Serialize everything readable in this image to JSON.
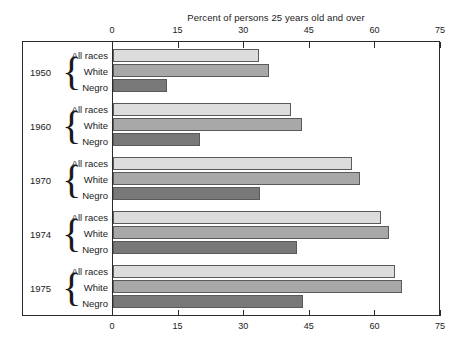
{
  "chart_data": {
    "type": "bar",
    "orientation": "horizontal",
    "title": "Percent of persons 25 years old and over",
    "xlabel": "",
    "ylabel": "",
    "xlim": [
      0,
      75
    ],
    "xticks": [
      0,
      15,
      30,
      45,
      60,
      75
    ],
    "xtick_labels": [
      "0",
      "15",
      "30",
      "45",
      "60",
      "75"
    ],
    "grid": false,
    "legend": "none",
    "axis_position": "both-top-and-bottom",
    "categories": [
      "1950",
      "1960",
      "1970",
      "1974",
      "1975"
    ],
    "series": [
      {
        "name": "All races",
        "color": "#dcdcdc",
        "values": [
          33.4,
          40.6,
          54.7,
          61.2,
          64.5
        ]
      },
      {
        "name": "White",
        "color": "#a8a8a8",
        "values": [
          35.7,
          43.2,
          56.4,
          63.0,
          66.0
        ]
      },
      {
        "name": "Negro",
        "color": "#787878",
        "values": [
          12.4,
          20.0,
          33.7,
          42.0,
          43.5
        ]
      }
    ],
    "groups": [
      {
        "year": "1950",
        "bars": [
          {
            "label": "All races",
            "value": 33.4
          },
          {
            "label": "White",
            "value": 35.7
          },
          {
            "label": "Negro",
            "value": 12.4
          }
        ]
      },
      {
        "year": "1960",
        "bars": [
          {
            "label": "All races",
            "value": 40.6
          },
          {
            "label": "White",
            "value": 43.2
          },
          {
            "label": "Negro",
            "value": 20.0
          }
        ]
      },
      {
        "year": "1970",
        "bars": [
          {
            "label": "All races",
            "value": 54.7
          },
          {
            "label": "White",
            "value": 56.4
          },
          {
            "label": "Negro",
            "value": 33.7
          }
        ]
      },
      {
        "year": "1974",
        "bars": [
          {
            "label": "All races",
            "value": 61.2
          },
          {
            "label": "White",
            "value": 63.0
          },
          {
            "label": "Negro",
            "value": 42.0
          }
        ]
      },
      {
        "year": "1975",
        "bars": [
          {
            "label": "All races",
            "value": 64.5
          },
          {
            "label": "White",
            "value": 66.0
          },
          {
            "label": "Negro",
            "value": 43.5
          }
        ]
      }
    ]
  },
  "colors": {
    "all_races": "#dcdcdc",
    "white": "#a8a8a8",
    "negro": "#787878",
    "frame": "#2b2b2b",
    "text": "#1a1a1a",
    "background": "#ffffff"
  },
  "brace_glyph": "{"
}
